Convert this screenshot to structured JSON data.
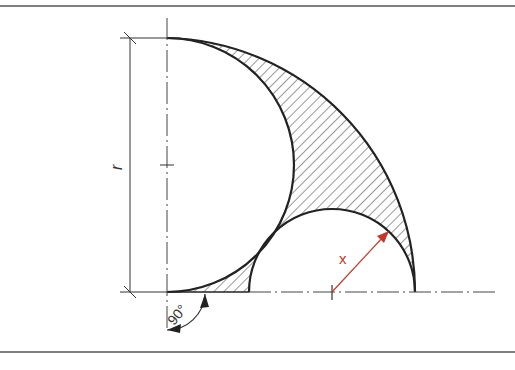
{
  "figure": {
    "labels": {
      "radius": "r",
      "unknown": "x",
      "angle": "90°"
    },
    "colors": {
      "line": "#222222",
      "hatch": "#333333",
      "dimension_x": "#c0392b",
      "frame": "#555555"
    }
  }
}
